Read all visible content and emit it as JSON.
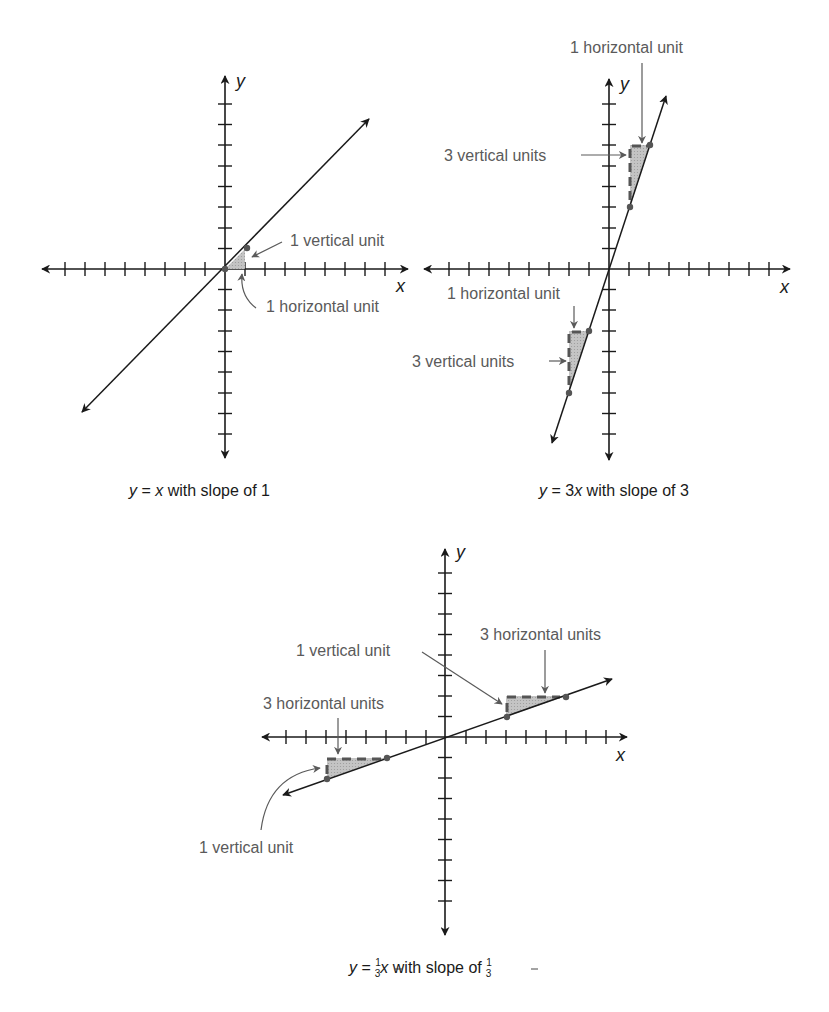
{
  "figure": {
    "colors": {
      "axis": "#1a1a1a",
      "line": "#1a1a1a",
      "label_text": "#5a5a5a",
      "dashed_leg": "#555555",
      "triangle_fill": "#bdbdbd",
      "point": "#555555",
      "background": "#ffffff"
    }
  },
  "graphs": [
    {
      "id": "slope-1",
      "equation_text": "y = x",
      "caption": {
        "y": "y",
        "eq": " = ",
        "x": "x",
        "rest": " with slope of 1"
      },
      "axis_labels": {
        "x": "x",
        "y": "y"
      },
      "slope": 1,
      "annotations": {
        "vertical": "1 vertical unit",
        "horizontal": "1 horizontal unit"
      },
      "rise_run_triangles": [
        {
          "from": [
            0,
            0
          ],
          "to": [
            1,
            1
          ],
          "run": 1,
          "rise": 1
        }
      ],
      "ticks_per_side": 8
    },
    {
      "id": "slope-3",
      "equation_text": "y = 3x",
      "caption": {
        "y": "y",
        "eq": " = 3",
        "x": "x",
        "rest": " with slope of 3"
      },
      "axis_labels": {
        "x": "x",
        "y": "y"
      },
      "slope": 3,
      "annotations": {
        "top_horizontal": "1 horizontal unit",
        "top_vertical": "3 vertical units",
        "bottom_horizontal": "1 horizontal unit",
        "bottom_vertical": "3 vertical units"
      },
      "rise_run_triangles": [
        {
          "from": [
            1,
            3
          ],
          "to": [
            2,
            6
          ],
          "run": 1,
          "rise": 3
        },
        {
          "from": [
            -2,
            -6
          ],
          "to": [
            -1,
            -3
          ],
          "run": 1,
          "rise": 3
        }
      ],
      "ticks_per_side": 8
    },
    {
      "id": "slope-one-third",
      "equation_text": "y = 1/3 x",
      "caption": {
        "y": "y",
        "eq": " = ",
        "frac_num": "1",
        "frac_den": "3",
        "x": "x",
        "rest": " with slope of ",
        "slope_num": "1",
        "slope_den": "3"
      },
      "axis_labels": {
        "x": "x",
        "y": "y"
      },
      "slope": 0.3333,
      "annotations": {
        "top_vertical": "1 vertical unit",
        "top_horizontal": "3 horizontal units",
        "bottom_horizontal": "3 horizontal units",
        "bottom_vertical": "1 vertical unit"
      },
      "rise_run_triangles": [
        {
          "from": [
            3,
            1
          ],
          "to": [
            6,
            2
          ],
          "run": 3,
          "rise": 1
        },
        {
          "from": [
            -6,
            -2
          ],
          "to": [
            -3,
            -1
          ],
          "run": 3,
          "rise": 1
        }
      ],
      "ticks_per_side": 8
    }
  ]
}
